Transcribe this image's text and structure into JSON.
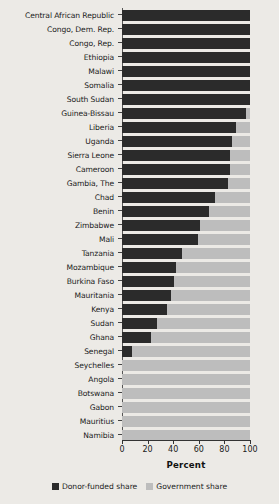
{
  "chart_data": {
    "type": "bar",
    "orientation": "horizontal",
    "stacked": true,
    "title": "",
    "xlabel": "Percent",
    "ylabel": "",
    "xlim": [
      0,
      100
    ],
    "xticks": [
      0,
      20,
      40,
      60,
      80,
      100
    ],
    "grid": false,
    "legend_position": "bottom",
    "categories": [
      "Central African Republic",
      "Congo, Dem. Rep.",
      "Congo, Rep.",
      "Ethiopia",
      "Malawi",
      "Somalia",
      "South Sudan",
      "Guinea-Bissau",
      "Liberia",
      "Uganda",
      "Sierra Leone",
      "Cameroon",
      "Gambia, The",
      "Chad",
      "Benin",
      "Zimbabwe",
      "Mali",
      "Tanzania",
      "Mozambique",
      "Burkina Faso",
      "Mauritania",
      "Kenya",
      "Sudan",
      "Ghana",
      "Senegal",
      "Seychelles",
      "Angola",
      "Botswana",
      "Gabon",
      "Mauritius",
      "Namibia"
    ],
    "series": [
      {
        "name": "Donor-funded share",
        "color": "#2b2b2b",
        "values": [
          100,
          100,
          100,
          100,
          100,
          100,
          100,
          97,
          89,
          86,
          84,
          84,
          83,
          73,
          68,
          61,
          59,
          47,
          42,
          41,
          38,
          35,
          27,
          23,
          8,
          0,
          0,
          0,
          0,
          0,
          0
        ]
      },
      {
        "name": "Government share",
        "color": "#bdbdbd",
        "values": [
          0,
          0,
          0,
          0,
          0,
          0,
          0,
          3,
          11,
          14,
          16,
          16,
          17,
          27,
          32,
          39,
          41,
          53,
          58,
          59,
          62,
          65,
          73,
          77,
          92,
          100,
          100,
          100,
          100,
          100,
          100
        ]
      }
    ]
  },
  "axis": {
    "x_title": "Percent",
    "x_tick_labels": [
      "0",
      "20",
      "40",
      "60",
      "80",
      "100"
    ]
  },
  "legend": {
    "items": [
      {
        "label": "Donor-funded share",
        "color": "#2b2b2b",
        "swatch_name": "donor-share-swatch"
      },
      {
        "label": "Government share",
        "color": "#bdbdbd",
        "swatch_name": "government-share-swatch"
      }
    ]
  }
}
